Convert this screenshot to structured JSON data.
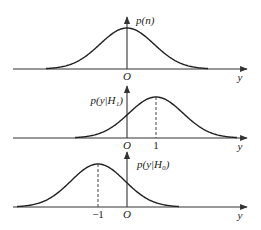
{
  "figure": {
    "panels": [
      {
        "id": "noise",
        "y_label": "p(n)",
        "x_label": "y",
        "origin_label": "O",
        "mean": 0,
        "tick_labels": [],
        "baseline_y": 69,
        "axis_top_y": 17,
        "peak_y": 28,
        "label_x": 136,
        "label_y": 24,
        "label_side": "right"
      },
      {
        "id": "h1",
        "y_label": "p(y|H₁)",
        "x_label": "y",
        "origin_label": "O",
        "mean": 1,
        "tick_labels": [
          "1"
        ],
        "baseline_y": 138,
        "axis_top_y": 86,
        "peak_y": 97,
        "label_x": 123,
        "label_y": 104,
        "label_side": "left"
      },
      {
        "id": "h0",
        "y_label": "p(y|H₀)",
        "x_label": "y",
        "origin_label": "O",
        "mean": -1,
        "tick_labels": [
          "−1"
        ],
        "baseline_y": 207,
        "axis_top_y": 152,
        "peak_y": 164,
        "label_x": 137,
        "label_y": 168,
        "label_side": "right"
      }
    ],
    "axis": {
      "x_start": 13,
      "x_end": 247,
      "origin_x": 127,
      "unit_px": 29,
      "sigma_px": 27
    },
    "colors": {
      "line": "#222222",
      "axis": "#333333",
      "background": "#ffffff"
    }
  }
}
